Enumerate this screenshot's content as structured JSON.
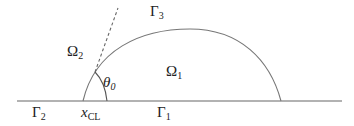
{
  "diagram": {
    "type": "droplet-contact-line-schematic",
    "colors": {
      "stroke": "#666666",
      "text": "#222222",
      "background": "#ffffff"
    },
    "labels": {
      "gamma3": {
        "main": "Γ",
        "sub": "3"
      },
      "omega2": {
        "main": "Ω",
        "sub": "2"
      },
      "omega1": {
        "main": "Ω",
        "sub": "1"
      },
      "theta0": {
        "main": "θ",
        "sub": "0"
      },
      "gamma2": {
        "main": "Γ",
        "sub": "2"
      },
      "xcl": {
        "main": "x",
        "sub": "CL"
      },
      "gamma1": {
        "main": "Γ",
        "sub": "1"
      }
    },
    "geometry": {
      "baseline": {
        "x1": 17,
        "x2": 342,
        "y": 101
      },
      "interface_arc": {
        "left_foot_x": 83,
        "right_foot_x": 281,
        "top_y": 29
      },
      "tangent_dashed": {
        "x1": 95,
        "y1": 72,
        "x2": 118,
        "y2": 8
      },
      "angle_arc": {
        "from": "tangent",
        "to": "baseline"
      }
    }
  }
}
